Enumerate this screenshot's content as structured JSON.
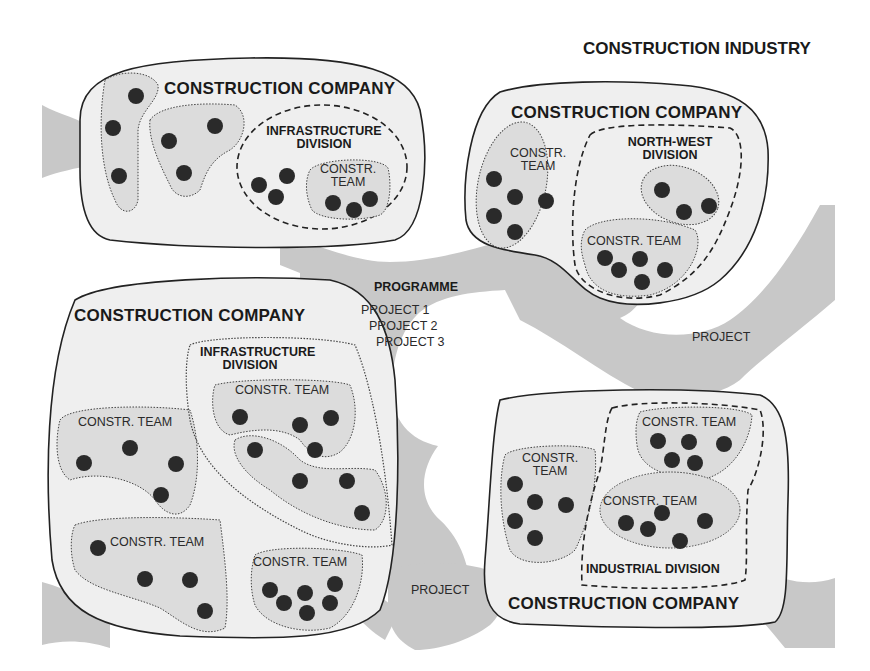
{
  "title": "CONSTRUCTION INDUSTRY",
  "colors": {
    "background": "#ffffff",
    "project_network": "#c8c8c8",
    "company_fill": "#efefef",
    "team_fill": "#dcdcdc",
    "member_dot": "#2a2a2a",
    "outline": "#222222"
  },
  "programme": {
    "label": "PROGRAMME",
    "projects": [
      "PROJECT 1",
      "PROJECT 2",
      "PROJECT 3"
    ]
  },
  "standalone_projects": [
    {
      "label": "PROJECT",
      "position": "right-middle"
    },
    {
      "label": "PROJECT",
      "position": "bottom-center"
    }
  ],
  "companies": [
    {
      "label": "CONSTRUCTION COMPANY",
      "position": "top-left",
      "divisions": [
        {
          "label": "INFRASTRUCTURE DIVISION",
          "line1": "INFRASTRUCTURE",
          "line2": "DIVISION",
          "teams": [
            {
              "label": "CONSTR. TEAM",
              "line1": "CONSTR.",
              "line2": "TEAM",
              "members": 3
            }
          ],
          "unassigned_members": 3
        }
      ],
      "unlabeled_teams": [
        {
          "members": 3
        },
        {
          "members": 3
        }
      ]
    },
    {
      "label": "CONSTRUCTION COMPANY",
      "position": "top-right",
      "teams": [
        {
          "label": "CONSTR. TEAM",
          "line1": "CONSTR.",
          "line2": "TEAM",
          "members": 5
        }
      ],
      "divisions": [
        {
          "label": "NORTH-WEST DIVISION",
          "line1": "NORTH-WEST",
          "line2": "DIVISION",
          "teams": [
            {
              "label": "",
              "members": 3
            },
            {
              "label": "CONSTR. TEAM",
              "members": 5
            }
          ]
        }
      ]
    },
    {
      "label": "CONSTRUCTION COMPANY",
      "position": "bottom-left",
      "teams": [
        {
          "label": "CONSTR. TEAM",
          "members": 4
        },
        {
          "label": "CONSTR. TEAM",
          "members": 4
        },
        {
          "label": "CONSTR. TEAM",
          "members": 6
        }
      ],
      "divisions": [
        {
          "label": "INFRASTRUCTURE DIVISION",
          "line1": "INFRASTRUCTURE",
          "line2": "DIVISION",
          "teams": [
            {
              "label": "CONSTR. TEAM",
              "members": 4
            },
            {
              "label": "",
              "members": 4
            }
          ]
        }
      ]
    },
    {
      "label": "CONSTRUCTION COMPANY",
      "position": "bottom-right",
      "teams": [
        {
          "label": "CONSTR. TEAM",
          "line1": "CONSTR.",
          "line2": "TEAM",
          "members": 5
        }
      ],
      "divisions": [
        {
          "label": "INDUSTRIAL DIVISION",
          "teams": [
            {
              "label": "CONSTR. TEAM",
              "members": 5
            },
            {
              "label": "CONSTR. TEAM",
              "members": 5
            }
          ]
        }
      ]
    }
  ]
}
